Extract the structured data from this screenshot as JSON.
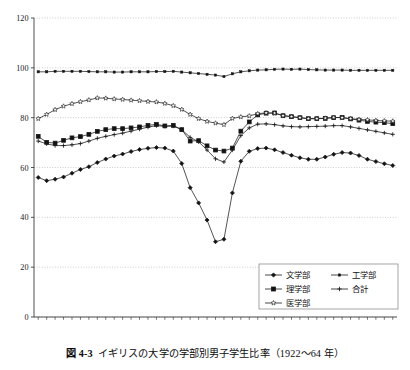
{
  "figure": {
    "caption_number": "図 4-3",
    "caption_text": "イギリスの大学の学部別男子学生比率（1922〜64 年）"
  },
  "chart_data": {
    "type": "line",
    "title": "",
    "subtitle": "",
    "xlabel": "",
    "ylabel": "",
    "xlim": [
      1921.5,
      1964.5
    ],
    "ylim": [
      0,
      120
    ],
    "yticks": [
      0,
      20,
      40,
      60,
      80,
      100,
      120
    ],
    "ytick_labels": [
      "0",
      "20",
      "40",
      "60",
      "80",
      "100",
      "120"
    ],
    "grid": "horizontal-dotted",
    "legend_position": "bottom-right",
    "x": [
      1922,
      1923,
      1924,
      1925,
      1926,
      1927,
      1928,
      1929,
      1930,
      1931,
      1932,
      1933,
      1934,
      1935,
      1936,
      1937,
      1938,
      1939,
      1940,
      1941,
      1942,
      1943,
      1944,
      1945,
      1946,
      1947,
      1948,
      1949,
      1950,
      1951,
      1952,
      1953,
      1954,
      1955,
      1956,
      1957,
      1958,
      1959,
      1960,
      1961,
      1962,
      1963,
      1964
    ],
    "xtick_values": [
      1922,
      1924,
      1926,
      1928,
      1930,
      1932,
      1934,
      1936,
      1938,
      1940,
      1942,
      1944,
      1946,
      1948,
      1950,
      1952,
      1954,
      1956,
      1958,
      1960,
      1962
    ],
    "xtick_labels": [
      "1922",
      "1924",
      "1926",
      "1928",
      "1930",
      "1932",
      "1934",
      "1936",
      "1938",
      "1940",
      "1942",
      "1944",
      "1946",
      "1948",
      "1950",
      "1952",
      "1954",
      "1956",
      "1958",
      "1960",
      "1962"
    ],
    "series": [
      {
        "name": "文学部",
        "marker": "diamond-filled",
        "values": [
          56.0,
          54.7,
          55.3,
          56.2,
          57.7,
          59.2,
          60.3,
          62.0,
          63.4,
          64.6,
          65.4,
          66.4,
          67.2,
          67.7,
          68.0,
          67.8,
          66.6,
          61.6,
          51.9,
          45.8,
          38.9,
          30.2,
          31.2,
          49.8,
          62.5,
          66.5,
          67.6,
          67.8,
          67.1,
          66.0,
          64.9,
          63.9,
          63.3,
          63.3,
          64.2,
          65.3,
          66.0,
          65.8,
          64.8,
          63.3,
          62.4,
          61.5,
          60.8
        ]
      },
      {
        "name": "理学部",
        "marker": "square-filled",
        "values": [
          72.5,
          70.1,
          69.8,
          70.9,
          71.9,
          72.4,
          73.3,
          74.5,
          75.2,
          75.6,
          75.6,
          75.9,
          76.3,
          76.9,
          77.3,
          76.7,
          76.9,
          75.2,
          70.6,
          70.8,
          68.7,
          67.0,
          66.6,
          67.8,
          74.6,
          78.3,
          81.1,
          81.8,
          81.9,
          80.8,
          80.4,
          80.0,
          79.6,
          79.6,
          79.7,
          80.0,
          80.1,
          79.5,
          79.0,
          78.5,
          78.2,
          78.0,
          77.6
        ]
      },
      {
        "name": "医学部",
        "marker": "star-open",
        "values": [
          79.6,
          81.3,
          83.2,
          84.6,
          85.6,
          86.4,
          87.1,
          87.9,
          87.8,
          87.5,
          87.3,
          87.0,
          86.8,
          86.5,
          86.3,
          85.7,
          84.8,
          83.3,
          81.3,
          79.6,
          78.5,
          77.8,
          77.2,
          79.7,
          80.3,
          80.7,
          81.6,
          81.9,
          81.8,
          80.8,
          80.4,
          80.0,
          79.6,
          79.6,
          79.8,
          80.1,
          80.0,
          79.6,
          79.3,
          79.1,
          78.9,
          78.7,
          78.6
        ]
      },
      {
        "name": "工学部",
        "marker": "square-small",
        "values": [
          98.4,
          98.4,
          98.6,
          98.6,
          98.6,
          98.6,
          98.5,
          98.4,
          98.4,
          98.3,
          98.3,
          98.4,
          98.4,
          98.4,
          98.5,
          98.5,
          98.6,
          98.3,
          98.0,
          97.7,
          97.4,
          97.1,
          96.5,
          97.6,
          98.4,
          98.8,
          99.1,
          99.2,
          99.4,
          99.5,
          99.4,
          99.5,
          99.3,
          99.2,
          99.1,
          99.1,
          99.1,
          99.0,
          99.0,
          99.0,
          99.0,
          99.0,
          99.0
        ]
      },
      {
        "name": "合計",
        "marker": "plus",
        "values": [
          70.6,
          69.5,
          68.8,
          68.8,
          69.1,
          69.6,
          70.6,
          71.7,
          72.5,
          73.2,
          73.8,
          74.6,
          75.4,
          76.2,
          76.8,
          76.5,
          76.6,
          75.2,
          72.1,
          70.3,
          67.0,
          63.5,
          62.2,
          67.0,
          72.8,
          75.9,
          77.4,
          77.5,
          77.2,
          76.7,
          76.4,
          76.3,
          76.4,
          76.5,
          76.6,
          76.8,
          76.8,
          76.3,
          75.7,
          75.1,
          74.5,
          73.9,
          73.3
        ]
      }
    ],
    "legend": [
      {
        "label": "文学部",
        "marker": "diamond-filled",
        "column": 0,
        "row": 0
      },
      {
        "label": "工学部",
        "marker": "square-small",
        "column": 1,
        "row": 0
      },
      {
        "label": "理学部",
        "marker": "square-filled",
        "column": 0,
        "row": 1
      },
      {
        "label": "合計",
        "marker": "plus",
        "column": 1,
        "row": 1
      },
      {
        "label": "医学部",
        "marker": "star-open",
        "column": 0,
        "row": 2
      }
    ],
    "colors": {
      "line": "#1a1a1a",
      "marker_fill": "#111111",
      "marker_open_fill": "#ffffff",
      "grid": "#b9b9b9",
      "axis": "#3d3d3d",
      "background": "#ffffff"
    }
  }
}
